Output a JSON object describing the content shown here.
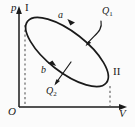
{
  "figure": {
    "kind": "p-V thermodynamic cycle diagram",
    "background_color": "#fbfbfb",
    "ink_color": "#1a1a1a"
  },
  "axes": {
    "vertical": {
      "label": "p",
      "name": "pressure-axis",
      "arrowhead": true,
      "x_px": 19,
      "y_top_px": 8,
      "y_bottom_px": 107
    },
    "horizontal": {
      "label": "V",
      "name": "volume-axis",
      "arrowhead": true,
      "y_px": 107,
      "x_left_px": 19,
      "x_right_px": 126
    },
    "origin_label": "O"
  },
  "cycle": {
    "shape": "tilted-ellipse",
    "center_px": [
      67,
      52
    ],
    "rx_px": 50,
    "ry_px": 20,
    "rotation_deg": 38,
    "stroke_width_px": 1.6,
    "direction": "counterclockwise",
    "states": [
      {
        "name": "state-I",
        "label": "I",
        "position_px": [
          25,
          22
        ]
      },
      {
        "name": "state-II",
        "label": "II",
        "position_px": [
          110,
          83
        ]
      }
    ],
    "paths": [
      {
        "name": "path-a",
        "label": "a",
        "segment": "upper",
        "arrow_at_px": [
          74,
          21
        ]
      },
      {
        "name": "path-b",
        "label": "b",
        "segment": "lower",
        "arrow_at_px": [
          50,
          66
        ]
      }
    ]
  },
  "heat_annotations": [
    {
      "name": "heat-absorbed",
      "label": "Q",
      "subscript": "1",
      "label_px": [
        102,
        6
      ],
      "arrow_from_px": [
        100,
        22
      ],
      "arrow_to_px": [
        86,
        45
      ],
      "description": "curved arrow from Q1 label into the upper branch of the cycle"
    },
    {
      "name": "heat-released",
      "label": "Q",
      "subscript": "2",
      "label_px": [
        46,
        86
      ],
      "arrow_from_px": [
        70,
        64
      ],
      "arrow_to_px": [
        54,
        84
      ],
      "description": "straight arrow crossing the lower branch of the cycle pointing down-left"
    }
  ],
  "guides": [
    {
      "name": "dashed-guide-state-I",
      "style": "dashed",
      "from_px": [
        25,
        24
      ],
      "to_px": [
        25,
        107
      ]
    },
    {
      "name": "dashed-guide-state-II",
      "style": "dashed",
      "from_px": [
        110,
        85
      ],
      "to_px": [
        110,
        107
      ]
    }
  ]
}
